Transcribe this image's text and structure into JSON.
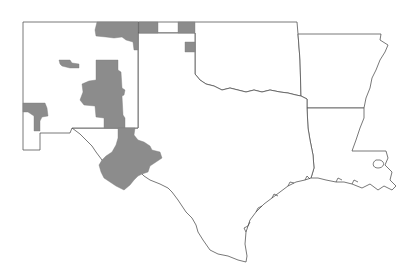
{
  "map": {
    "title": "",
    "region": "South-Central United States",
    "states": [
      {
        "id": "NM",
        "name": "New Mexico"
      },
      {
        "id": "TX",
        "name": "Texas"
      },
      {
        "id": "OK",
        "name": "Oklahoma"
      },
      {
        "id": "AR",
        "name": "Arkansas"
      },
      {
        "id": "LA",
        "name": "Louisiana"
      }
    ],
    "colors": {
      "background": "#ffffff",
      "boundary": "#555555",
      "shaded_region": "#8c8c8c"
    },
    "shaded_regions": [
      {
        "id": "nm-north-central",
        "state": "NM"
      },
      {
        "id": "nm-west-central-small",
        "state": "NM"
      },
      {
        "id": "nm-central-large",
        "state": "NM"
      },
      {
        "id": "nm-southwest",
        "state": "NM"
      },
      {
        "id": "ok-panhandle-west",
        "state": "OK"
      },
      {
        "id": "ok-panhandle-east",
        "state": "OK"
      },
      {
        "id": "tx-panhandle-small",
        "state": "TX"
      },
      {
        "id": "tx-trans-pecos",
        "state": "TX"
      }
    ]
  }
}
